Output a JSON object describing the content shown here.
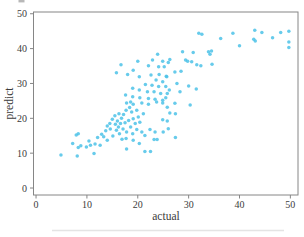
{
  "chart_data": {
    "type": "scatter",
    "title": "",
    "xlabel": "actual",
    "ylabel": "predict",
    "xlim": [
      -0.5,
      51.5
    ],
    "ylim": [
      -2,
      50.5
    ],
    "x_ticks": [
      0,
      10,
      20,
      30,
      40,
      50
    ],
    "y_ticks": [
      0,
      10,
      20,
      30,
      40,
      50
    ],
    "grid": false,
    "legend": null,
    "marker_color": "#4cc2e8",
    "marker_opacity": 0.85,
    "marker_radius": 1.75,
    "spine_color": "#868686",
    "text_color": "#3c3c3c",
    "points": [
      [
        4.9,
        9.5
      ],
      [
        7.2,
        12.8
      ],
      [
        7.9,
        15.2
      ],
      [
        8.3,
        15.6
      ],
      [
        8.3,
        11.6
      ],
      [
        8.8,
        12.1
      ],
      [
        8.1,
        9.2
      ],
      [
        9.9,
        11.8
      ],
      [
        10.4,
        13.5
      ],
      [
        10.7,
        12.3
      ],
      [
        11.4,
        9.9
      ],
      [
        11.6,
        12.6
      ],
      [
        12.1,
        14.5
      ],
      [
        12.6,
        12.3
      ],
      [
        12.9,
        15.4
      ],
      [
        13.3,
        14.7
      ],
      [
        13.7,
        16.4
      ],
      [
        14.0,
        17.8
      ],
      [
        14.0,
        13.7
      ],
      [
        14.5,
        18.5
      ],
      [
        14.6,
        16.9
      ],
      [
        15.0,
        19.7
      ],
      [
        15.1,
        14.9
      ],
      [
        15.5,
        20.7
      ],
      [
        15.6,
        18.3
      ],
      [
        15.8,
        16.6
      ],
      [
        16.0,
        19.2
      ],
      [
        16.2,
        17.5
      ],
      [
        16.3,
        21.3
      ],
      [
        16.4,
        15.6
      ],
      [
        16.6,
        18.5
      ],
      [
        16.8,
        20.0
      ],
      [
        16.9,
        14.0
      ],
      [
        17.1,
        16.9
      ],
      [
        17.2,
        21.1
      ],
      [
        15.8,
        33.1
      ],
      [
        17.8,
        24.4
      ],
      [
        18.6,
        24.7
      ],
      [
        19.1,
        24.0
      ],
      [
        18.4,
        23.1
      ],
      [
        17.7,
        22.3
      ],
      [
        18.8,
        21.8
      ],
      [
        19.8,
        22.3
      ],
      [
        20.8,
        24.4
      ],
      [
        22.1,
        24.0
      ],
      [
        23.7,
        24.7
      ],
      [
        24.9,
        24.4
      ],
      [
        25.8,
        23.2
      ],
      [
        21.1,
        21.3
      ],
      [
        20.1,
        20.4
      ],
      [
        19.1,
        19.9
      ],
      [
        18.2,
        19.4
      ],
      [
        17.5,
        18.7
      ],
      [
        19.5,
        18.5
      ],
      [
        20.4,
        18.9
      ],
      [
        18.6,
        17.5
      ],
      [
        19.8,
        16.8
      ],
      [
        17.8,
        16.1
      ],
      [
        19.0,
        15.6
      ],
      [
        20.8,
        16.1
      ],
      [
        21.4,
        15.1
      ],
      [
        17.7,
        14.2
      ],
      [
        19.1,
        13.7
      ],
      [
        22.4,
        16.8
      ],
      [
        23.4,
        16.1
      ],
      [
        23.2,
        13.9
      ],
      [
        23.8,
        13.9
      ],
      [
        25.0,
        16.1
      ],
      [
        26.0,
        17.0
      ],
      [
        20.3,
        12.8
      ],
      [
        24.9,
        19.6
      ],
      [
        25.8,
        19.2
      ],
      [
        26.3,
        21.5
      ],
      [
        27.4,
        21.3
      ],
      [
        27.4,
        14.5
      ],
      [
        21.4,
        10.5
      ],
      [
        22.5,
        10.5
      ],
      [
        17.8,
        11.2
      ],
      [
        20.0,
        36.4
      ],
      [
        22.9,
        36.7
      ],
      [
        24.9,
        36.4
      ],
      [
        22.1,
        35.1
      ],
      [
        24.1,
        34.8
      ],
      [
        25.2,
        34.8
      ],
      [
        16.7,
        35.4
      ],
      [
        19.1,
        33.8
      ],
      [
        18.0,
        32.6
      ],
      [
        20.3,
        31.9
      ],
      [
        22.6,
        32.4
      ],
      [
        24.2,
        32.6
      ],
      [
        25.6,
        32.1
      ],
      [
        23.6,
        31.0
      ],
      [
        24.9,
        30.5
      ],
      [
        21.5,
        29.7
      ],
      [
        22.8,
        29.5
      ],
      [
        24.1,
        29.1
      ],
      [
        25.5,
        29.1
      ],
      [
        19.0,
        28.6
      ],
      [
        20.3,
        28.1
      ],
      [
        21.9,
        27.6
      ],
      [
        23.2,
        27.6
      ],
      [
        24.5,
        27.1
      ],
      [
        25.8,
        27.1
      ],
      [
        17.6,
        26.7
      ],
      [
        19.0,
        26.2
      ],
      [
        20.4,
        25.9
      ],
      [
        22.1,
        25.7
      ],
      [
        23.4,
        25.5
      ],
      [
        24.9,
        25.2
      ],
      [
        29.4,
        36.7
      ],
      [
        29.8,
        36.4
      ],
      [
        30.6,
        36.2
      ],
      [
        31.6,
        35.4
      ],
      [
        32.4,
        35.1
      ],
      [
        26.0,
        36.0
      ],
      [
        27.3,
        33.3
      ],
      [
        28.5,
        33.5
      ],
      [
        25.7,
        31.9
      ],
      [
        27.7,
        30.0
      ],
      [
        26.2,
        28.1
      ],
      [
        28.3,
        27.6
      ],
      [
        25.5,
        25.9
      ],
      [
        27.3,
        24.3
      ],
      [
        30.3,
        23.8
      ],
      [
        30.0,
        29.3
      ],
      [
        31.5,
        28.4
      ],
      [
        23.9,
        38.4
      ],
      [
        26.3,
        36.9
      ],
      [
        28.8,
        39.1
      ],
      [
        30.9,
        38.9
      ],
      [
        32.0,
        44.4
      ],
      [
        32.6,
        44.1
      ],
      [
        33.9,
        39.1
      ],
      [
        34.2,
        38.4
      ],
      [
        34.5,
        39.3
      ],
      [
        34.6,
        35.5
      ],
      [
        36.3,
        42.9
      ],
      [
        38.7,
        44.4
      ],
      [
        40.0,
        40.8
      ],
      [
        43.1,
        42.2
      ],
      [
        43.0,
        45.3
      ],
      [
        44.4,
        44.6
      ],
      [
        46.5,
        43.1
      ],
      [
        48.1,
        44.6
      ],
      [
        42.8,
        42.7
      ],
      [
        49.7,
        45.0
      ],
      [
        49.7,
        41.9
      ],
      [
        49.7,
        40.3
      ]
    ]
  }
}
